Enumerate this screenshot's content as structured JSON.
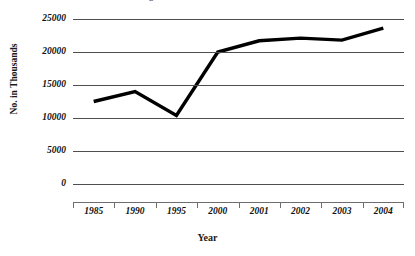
{
  "chart_data": {
    "type": "line",
    "title": "Figure 1. Number of Beneficiaries",
    "xlabel": "Year",
    "ylabel": "No. in Thousands",
    "categories": [
      "1985",
      "1990",
      "1995",
      "2000",
      "2001",
      "2002",
      "2003",
      "2004"
    ],
    "values": [
      12500,
      14000,
      10400,
      20000,
      21700,
      22100,
      21800,
      23600
    ],
    "series": [
      {
        "name": "No. in Thousands",
        "values": [
          12500,
          14000,
          10400,
          20000,
          21700,
          22100,
          21800,
          23600
        ]
      }
    ],
    "ylim": [
      0,
      25000
    ],
    "yticks": [
      0,
      5000,
      10000,
      15000,
      20000,
      25000
    ],
    "ytick_labels": [
      "0",
      "5000",
      "10000",
      "15000",
      "20000",
      "25000"
    ],
    "grid": "horizontal",
    "legend": "none",
    "line_color": "#000000",
    "gridline_color": "#4f4f4f",
    "axis_color": "#6e6e6e"
  }
}
